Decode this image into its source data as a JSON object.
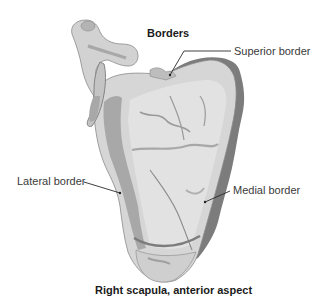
{
  "diagram": {
    "title": "Borders",
    "caption": "Right scapula, anterior aspect",
    "labels": {
      "superior": "Superior border",
      "lateral": "Lateral border",
      "medial": "Medial border"
    },
    "colors": {
      "bone_fill": "#d6d6d6",
      "bone_light": "#e4e4e4",
      "bone_shade": "#a8a8a8",
      "border_dark": "#7c7c7c",
      "outline": "#8a8a8a",
      "text": "#3a3a3a",
      "leader": "#2a2a2a",
      "background": "#ffffff"
    }
  }
}
